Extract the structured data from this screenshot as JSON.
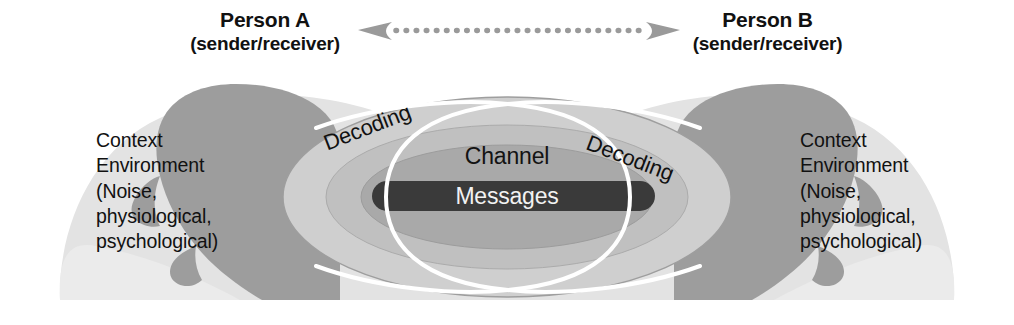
{
  "diagram": {
    "background_color": "#ffffff"
  },
  "header": {
    "person_a": {
      "name": "Person A",
      "role": "(sender/receiver)"
    },
    "person_b": {
      "name": "Person B",
      "role": "(sender/receiver)"
    },
    "connector": {
      "icon": "double-headed-dotted-arrow",
      "color": "#9a9a9a",
      "dot_count": 25
    }
  },
  "context": {
    "left": {
      "lines": [
        "Context",
        "Environment",
        "(Noise,",
        "physiological,",
        "psychological)"
      ],
      "text": "Context\nEnvironment\n(Noise,\nphysiological,\npsychological)"
    },
    "right": {
      "lines": [
        "Context",
        "Environment",
        "(Noise,",
        "physiological,",
        "psychological)"
      ],
      "text": "Context\nEnvironment\n(Noise,\nphysiological,\npsychological)"
    }
  },
  "rings": {
    "decoding_left": "Decoding",
    "decoding_right": "Decoding",
    "channel": "Channel",
    "messages": "Messages"
  },
  "colors": {
    "page_background": "#ffffff",
    "shoulder_blob": "#e3e3e3",
    "outer_ellipse": "#cfcfcf",
    "outer_ellipse_stroke": "#9e9e9e",
    "middle_ellipse": "#c2c2c2",
    "inner_ellipse": "#a8a8a8",
    "messages_bar": "#3a3a3a",
    "head_silhouette": "#9d9d9d",
    "head_silhouette_dark": "#8a8a8a",
    "vesica_stroke": "#ffffff",
    "text_dark": "#111111",
    "text_light": "#f2f2f2"
  },
  "shapes": {
    "vesica": {
      "top_vertex": [
        508,
        104
      ],
      "bottom_vertex": [
        508,
        290
      ],
      "stroke_width": 4
    },
    "messages_bar": {
      "x": 372,
      "y": 181,
      "width": 283,
      "height": 30,
      "radius": 15
    }
  }
}
